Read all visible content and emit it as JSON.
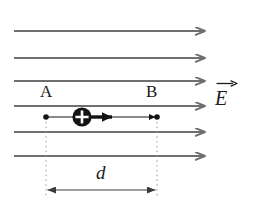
{
  "figure": {
    "background_color": "#ffffff",
    "width": 253,
    "height": 209,
    "labels": {
      "point_a": "A",
      "point_b": "B",
      "distance": "d",
      "field": "E"
    },
    "colors": {
      "field_line": "#6f6f6f",
      "charge_fill": "#141414",
      "charge_symbol": "#ffffff",
      "motion_arrow": "#141414",
      "guide_dashed": "#9a9a9a",
      "dimension_line": "#3a3a3a",
      "text": "#1a1a1a",
      "endpoint_dot": "#141414"
    },
    "field_lines": {
      "count": 6,
      "direction": "right",
      "x_start": 14,
      "x_end": 208,
      "y_positions": [
        31,
        58,
        81,
        106,
        132,
        156
      ],
      "stroke_width": 2.2,
      "arrowhead_style": "open-chevron"
    },
    "charge": {
      "symbol": "+",
      "polarity": "positive",
      "center_x": 82,
      "center_y": 117,
      "radius": 9.5
    },
    "motion_arrow": {
      "x_start": 90,
      "x_end": 119,
      "y": 117,
      "stroke_width": 3.4
    },
    "trajectory": {
      "x_start": 46,
      "x_end": 157,
      "y": 117
    },
    "endpoints": [
      {
        "name": "A",
        "x": 46,
        "y": 117,
        "radius": 2.6
      },
      {
        "name": "B",
        "x": 157,
        "y": 117,
        "radius": 2.6
      }
    ],
    "guides": [
      {
        "x": 46,
        "y_top": 117,
        "y_bottom": 196
      },
      {
        "x": 157,
        "y_top": 117,
        "y_bottom": 196
      }
    ],
    "dimension": {
      "x_left": 46,
      "x_right": 157,
      "y": 190,
      "label": "d",
      "double_headed": true
    }
  }
}
